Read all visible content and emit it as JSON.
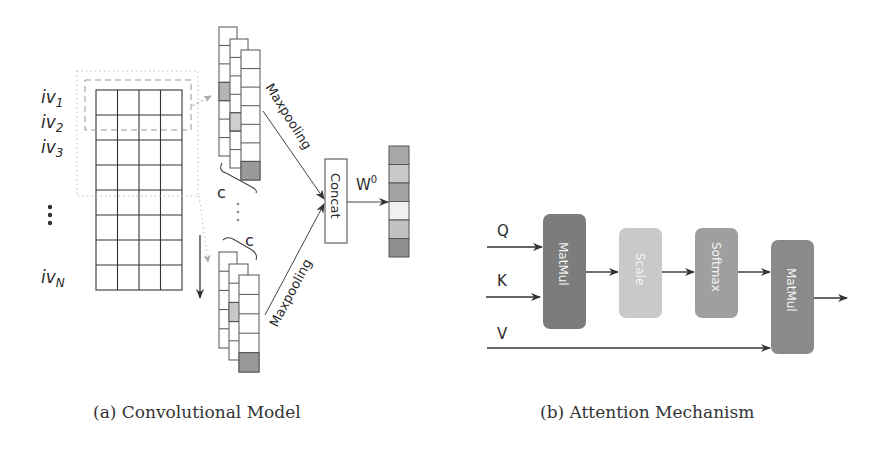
{
  "figure_a": {
    "caption": "(a) Convolutional Model",
    "row_labels": [
      {
        "base": "iv",
        "sub": "1"
      },
      {
        "base": "iv",
        "sub": "2"
      },
      {
        "base": "iv",
        "sub": "3"
      },
      {
        "base": "⋮",
        "sub": ""
      },
      {
        "base": "iv",
        "sub": "N"
      }
    ],
    "grid": {
      "rows": 8,
      "cols": 4
    },
    "filter_width_label": "c",
    "ellipsis": "⋮",
    "maxpool_label_top": "Maxpooling",
    "maxpool_label_bottom": "Maxpooling",
    "concat_label": "Concat",
    "weight_label": {
      "base": "W",
      "sup": "0"
    },
    "top_feature_maps": [
      {
        "cells": 7,
        "shaded_index": 3,
        "shade": "#b4b4b4"
      },
      {
        "cells": 7,
        "shaded_index": 4,
        "shade": "#cfcfcf"
      },
      {
        "cells": 7,
        "shaded_index": 6,
        "shade": "#9a9a9a"
      }
    ],
    "bottom_feature_maps": [
      {
        "cells": 5,
        "shaded_index": -1,
        "shade": "#ffffff"
      },
      {
        "cells": 5,
        "shaded_index": 2,
        "shade": "#c8c8c8"
      },
      {
        "cells": 5,
        "shaded_index": 4,
        "shade": "#9a9a9a"
      }
    ],
    "output_vector_colors": [
      "#a8a8a8",
      "#c9c9c9",
      "#a3a3a3",
      "#f0f0f0",
      "#c2c2c2",
      "#8e8e8e"
    ]
  },
  "figure_b": {
    "caption": "(b) Attention Mechanism",
    "inputs": [
      "Q",
      "K",
      "V"
    ],
    "blocks": [
      {
        "label": "MatMul",
        "color": "#7c7c7c"
      },
      {
        "label": "Scale",
        "color": "#c9c9c9"
      },
      {
        "label": "Softmax",
        "color": "#9f9f9f"
      },
      {
        "label": "MatMul",
        "color": "#8a8a8a"
      }
    ]
  }
}
